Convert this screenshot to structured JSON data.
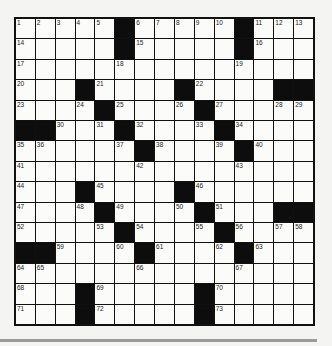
{
  "puzzle": {
    "rows": 15,
    "cols": 15,
    "colors": {
      "background": "#f4f4f2",
      "cell": "#fbfbfa",
      "block": "#0d0d0d",
      "grid_line": "#111111",
      "bottom_rule": "#9b9b9b"
    },
    "grid": [
      "#####B#####B###",
      "#####B#####B###",
      "###############",
      "###B####B####BB",
      "####B####B#####",
      "BB###B####B####",
      "######B####B###",
      "###############",
      "###B####B######",
      "####B####B###BB",
      "#####B####B####",
      "BB####B####B###",
      "###############",
      "###B#####B#####",
      "###B#####B#####"
    ],
    "numbers": [
      [
        1,
        2,
        3,
        4,
        5,
        0,
        6,
        7,
        8,
        9,
        10,
        0,
        11,
        12,
        13
      ],
      [
        14,
        0,
        0,
        0,
        0,
        0,
        15,
        0,
        0,
        0,
        0,
        0,
        16,
        0,
        0
      ],
      [
        17,
        0,
        0,
        0,
        0,
        18,
        0,
        0,
        0,
        0,
        0,
        19,
        0,
        0,
        0
      ],
      [
        20,
        0,
        0,
        0,
        21,
        0,
        0,
        0,
        0,
        22,
        0,
        0,
        0,
        0,
        0
      ],
      [
        23,
        0,
        0,
        24,
        0,
        25,
        0,
        0,
        26,
        0,
        27,
        0,
        0,
        28,
        29
      ],
      [
        0,
        0,
        30,
        0,
        31,
        0,
        32,
        0,
        0,
        33,
        0,
        34,
        0,
        0,
        0
      ],
      [
        35,
        36,
        0,
        0,
        0,
        37,
        0,
        38,
        0,
        0,
        39,
        0,
        40,
        0,
        0
      ],
      [
        41,
        0,
        0,
        0,
        0,
        0,
        42,
        0,
        0,
        0,
        0,
        43,
        0,
        0,
        0
      ],
      [
        44,
        0,
        0,
        0,
        45,
        0,
        0,
        0,
        0,
        46,
        0,
        0,
        0,
        0,
        0
      ],
      [
        47,
        0,
        0,
        48,
        0,
        49,
        0,
        0,
        50,
        0,
        51,
        0,
        0,
        0,
        0
      ],
      [
        52,
        0,
        0,
        0,
        53,
        0,
        54,
        0,
        0,
        55,
        0,
        56,
        0,
        57,
        58
      ],
      [
        0,
        0,
        59,
        0,
        0,
        60,
        0,
        61,
        0,
        0,
        62,
        0,
        63,
        0,
        0
      ],
      [
        64,
        65,
        0,
        0,
        0,
        0,
        66,
        0,
        0,
        0,
        0,
        67,
        0,
        0,
        0
      ],
      [
        68,
        0,
        0,
        0,
        69,
        0,
        0,
        0,
        0,
        0,
        70,
        0,
        0,
        0,
        0
      ],
      [
        71,
        0,
        0,
        0,
        72,
        0,
        0,
        0,
        0,
        0,
        73,
        0,
        0,
        0,
        0
      ]
    ]
  }
}
